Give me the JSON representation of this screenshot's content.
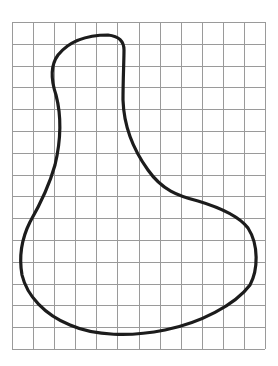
{
  "diagram": {
    "type": "grid-shape",
    "background": "#ffffff",
    "grid": {
      "left": 12,
      "top": 22,
      "right": 265,
      "bottom": 349,
      "columns": 12,
      "rows": 15,
      "line_color": "#9a9a9a",
      "line_width": 1
    },
    "shape": {
      "stroke": "#1c1c1c",
      "stroke_width": 3.2,
      "fill": "none",
      "path": "M123,100 C123,80 124,60 124,50 C124,40 118,36 108,35 C90,35 70,40 58,55 C50,66 51,80 56,95 C62,118 61,140 55,165 C48,190 38,208 30,222 C21,240 19,258 22,275 C27,296 45,315 70,325 C95,336 130,337 165,330 C200,323 235,305 250,285 C258,270 259,245 248,228 C238,215 218,207 198,201 C178,196 162,190 148,170 C135,152 124,130 123,100 Z"
    }
  }
}
